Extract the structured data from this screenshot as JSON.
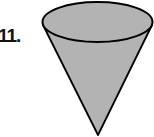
{
  "problem": {
    "number_label": "11.",
    "figure": "cone",
    "fill_color": "#b3b3b3",
    "stroke_color": "#000000"
  }
}
